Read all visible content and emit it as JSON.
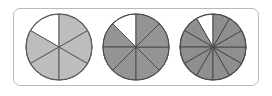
{
  "figure": {
    "name": "fraction-circles-figure",
    "background_color": "#ffffff",
    "frame": {
      "border_color": "#b9b9b9",
      "corner_radius": 7,
      "fill": "#ffffff"
    }
  },
  "chart_data": {
    "type": "pie",
    "title": "",
    "subtitle": "",
    "xlabel": "",
    "ylabel": "",
    "legend": [],
    "grid": false,
    "charts": [
      {
        "name": "circle-five-sixths",
        "label": "5/6",
        "total_sectors": 6,
        "shaded_sectors": 5,
        "unshaded_sectors": 1,
        "fraction_numerator": 5,
        "fraction_denominator": 6,
        "sector_angle_deg": 60,
        "unshaded_start_deg": 300,
        "unshaded_end_deg": 360,
        "shaded_color": "#bdbdbd",
        "unshaded_color": "#ffffff",
        "outline_color": "#5a5a5a",
        "radius_px": 33,
        "values": [
          60,
          60,
          60,
          60,
          60,
          60
        ],
        "slice_states": [
          "unshaded",
          "shaded",
          "shaded",
          "shaded",
          "shaded",
          "shaded"
        ]
      },
      {
        "name": "circle-seven-eighths",
        "label": "7/8",
        "total_sectors": 8,
        "shaded_sectors": 7,
        "unshaded_sectors": 1,
        "fraction_numerator": 7,
        "fraction_denominator": 8,
        "sector_angle_deg": 45,
        "unshaded_start_deg": 315,
        "unshaded_end_deg": 360,
        "shaded_color": "#949494",
        "unshaded_color": "#ffffff",
        "outline_color": "#4f4f4f",
        "radius_px": 33,
        "values": [
          45,
          45,
          45,
          45,
          45,
          45,
          45,
          45
        ],
        "slice_states": [
          "unshaded",
          "shaded",
          "shaded",
          "shaded",
          "shaded",
          "shaded",
          "shaded",
          "shaded"
        ]
      },
      {
        "name": "circle-eleven-twelfths",
        "label": "11/12",
        "total_sectors": 12,
        "shaded_sectors": 11,
        "unshaded_sectors": 1,
        "fraction_numerator": 11,
        "fraction_denominator": 12,
        "sector_angle_deg": 30,
        "unshaded_start_deg": 330,
        "unshaded_end_deg": 360,
        "shaded_color": "#8f8f8f",
        "unshaded_color": "#ffffff",
        "outline_color": "#4a4a4a",
        "radius_px": 33,
        "values": [
          30,
          30,
          30,
          30,
          30,
          30,
          30,
          30,
          30,
          30,
          30,
          30
        ],
        "slice_states": [
          "unshaded",
          "shaded",
          "shaded",
          "shaded",
          "shaded",
          "shaded",
          "shaded",
          "shaded",
          "shaded",
          "shaded",
          "shaded",
          "shaded"
        ]
      }
    ]
  }
}
